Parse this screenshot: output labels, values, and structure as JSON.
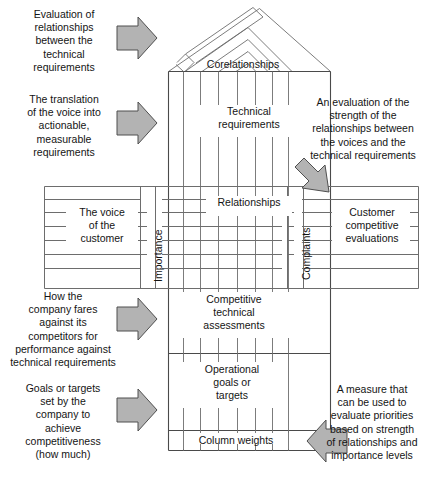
{
  "diagram": {
    "colors": {
      "line": "#6d6d6d",
      "line_dark": "#4a4a4a",
      "arrow_fill": "#b3b3b3",
      "arrow_stroke": "#4f4f4f",
      "text": "#141414",
      "background": "#ffffff"
    },
    "house_labels": [
      {
        "name": "corelationships",
        "text": "Corelationships"
      },
      {
        "name": "technical-requirements",
        "text": "Technical\nrequirements"
      },
      {
        "name": "relationships",
        "text": "Relationships"
      },
      {
        "name": "voice-of-the-customer",
        "text": "The voice\nof the\ncustomer"
      },
      {
        "name": "importance",
        "text": "Importance"
      },
      {
        "name": "complaints",
        "text": "Complaints"
      },
      {
        "name": "customer-competitive-evaluations",
        "text": "Customer\ncompetitive\nevaluations"
      },
      {
        "name": "competitive-technical-assessments",
        "text": "Competitive\ntechnical\nassessments"
      },
      {
        "name": "operational-goals-or-targets",
        "text": "Operational\ngoals or\ntargets"
      },
      {
        "name": "column-weights",
        "text": "Column weights"
      }
    ],
    "annotations": [
      {
        "name": "annotation-corelationships",
        "text": "Evaluation of\nrelationships\nbetween the\ntechnical\nrequirements",
        "arrow": "right"
      },
      {
        "name": "annotation-technical-requirements",
        "text": "The translation\nof the voice into\nactionable,\nmeasurable\nrequirements",
        "arrow": "right"
      },
      {
        "name": "annotation-relationships",
        "text": "An evaluation of the\nstrength of the\nrelationships between\nthe voices and the\ntechnical requirements",
        "arrow": "down-left"
      },
      {
        "name": "annotation-competitive-technical-assessments",
        "text": "How the\ncompany fares\nagainst its\ncompetitors for\nperformance against\ntechnical requirements",
        "arrow": "right"
      },
      {
        "name": "annotation-operational-goals",
        "text": "Goals or targets\nset by the\ncompany to\nachieve\ncompetitiveness\n(how much)",
        "arrow": "right"
      },
      {
        "name": "annotation-column-weights",
        "text": "A measure that\ncan be used to\nevaluate priorities\nbased on strength\nof relationships and\nimportance levels",
        "arrow": "left"
      }
    ]
  }
}
